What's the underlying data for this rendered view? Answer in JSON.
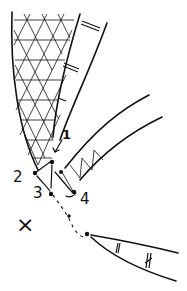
{
  "diagram": {
    "type": "hand-drawn schematic",
    "point_labels": [
      {
        "id": "p1",
        "label": "1"
      },
      {
        "id": "p2",
        "label": "2"
      },
      {
        "id": "p3",
        "label": "3"
      },
      {
        "id": "p4",
        "label": "4"
      }
    ],
    "marker": {
      "label": "×"
    },
    "colors": {
      "ink": "#111111",
      "background": "#ffffff"
    }
  }
}
